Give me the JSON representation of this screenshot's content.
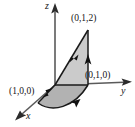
{
  "figure": {
    "kind": "3d-coordinate-surface-diagram",
    "width": 135,
    "height": 127,
    "background": "#ffffff",
    "stroke_color": "#1a1a1a",
    "fill_light": "#c9c9c9",
    "fill_dark": "#b0b0b0",
    "axis_color": "#4d4d4d"
  },
  "axes": [
    {
      "name": "z",
      "label": "z",
      "direction": "up",
      "label_x": 45,
      "label_y": 1
    },
    {
      "name": "y",
      "label": "y",
      "direction": "right",
      "label_x": 121,
      "label_y": 86
    },
    {
      "name": "x",
      "label": "x",
      "direction": "down-left",
      "label_x": 26,
      "label_y": 111
    }
  ],
  "points": [
    {
      "id": "p012",
      "label": "(0,1,2)",
      "coords": [
        0,
        1,
        2
      ],
      "label_x": 71,
      "label_y": 14,
      "vertex_x": 88,
      "vertex_y": 30
    },
    {
      "id": "p010",
      "label": "(0,1,0)",
      "coords": [
        0,
        1,
        0
      ],
      "label_x": 85,
      "label_y": 71,
      "vertex_x": 88,
      "vertex_y": 85
    },
    {
      "id": "p100",
      "label": "(1,0,0)",
      "coords": [
        1,
        0,
        0
      ],
      "label_x": 9,
      "label_y": 87,
      "vertex_x": 38,
      "vertex_y": 103
    }
  ],
  "origin": {
    "x": 55,
    "y": 85
  },
  "orientation_arrows": [
    {
      "id": "arrow-hypotenuse",
      "on": "segment (0,1,2) to origin",
      "direction": "down-left",
      "at_x": 73,
      "at_y": 58
    },
    {
      "id": "arrow-vertical",
      "on": "segment (0,1,0) to (0,1,2)",
      "direction": "up",
      "at_x": 88,
      "at_y": 62
    },
    {
      "id": "arrow-arc",
      "on": "arc (1,0,0) to (0,1,0)",
      "direction": "right",
      "at_x": 72,
      "at_y": 101
    },
    {
      "id": "arrow-x-edge",
      "on": "segment (1,0,0) to origin",
      "direction": "up-right",
      "at_x": 47,
      "at_y": 94
    }
  ],
  "regions": [
    {
      "id": "upper-triangle",
      "fill": "#c9c9c9",
      "vertices": "origin, (0,1,2), (0,1,0)"
    },
    {
      "id": "lower-lobe",
      "fill": "#b0b0b0",
      "vertices": "origin, (0,1,0), arc, (1,0,0)"
    }
  ]
}
